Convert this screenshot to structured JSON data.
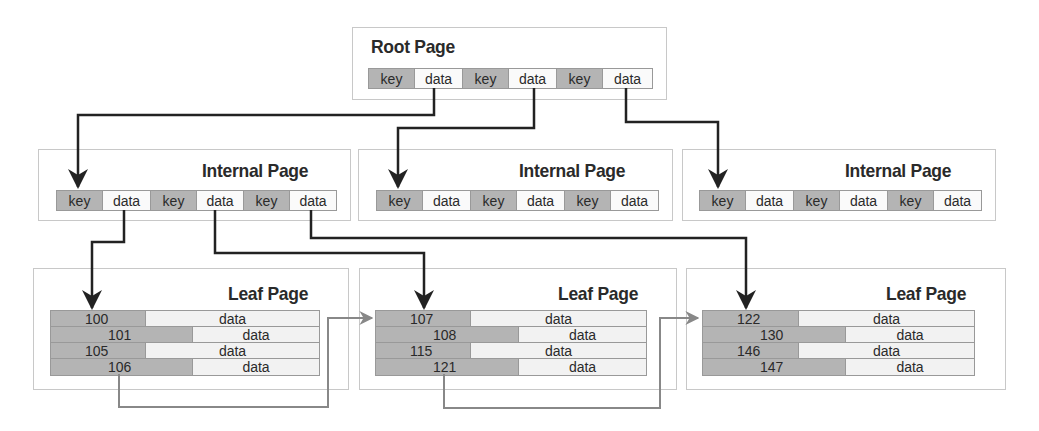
{
  "root": {
    "title": "Root Page",
    "cells": [
      "key",
      "data",
      "key",
      "data",
      "key",
      "data"
    ]
  },
  "internal": [
    {
      "title": "Internal Page",
      "cells": [
        "key",
        "data",
        "key",
        "data",
        "key",
        "data"
      ]
    },
    {
      "title": "Internal Page",
      "cells": [
        "key",
        "data",
        "key",
        "data",
        "key",
        "data"
      ]
    },
    {
      "title": "Internal Page",
      "cells": [
        "key",
        "data",
        "key",
        "data",
        "key",
        "data"
      ]
    }
  ],
  "leaves": [
    {
      "title": "Leaf Page",
      "rows": [
        {
          "key": "100",
          "data": "data"
        },
        {
          "key": "101",
          "data": "data"
        },
        {
          "key": "105",
          "data": "data"
        },
        {
          "key": "106",
          "data": "data"
        }
      ]
    },
    {
      "title": "Leaf Page",
      "rows": [
        {
          "key": "107",
          "data": "data"
        },
        {
          "key": "108",
          "data": "data"
        },
        {
          "key": "115",
          "data": "data"
        },
        {
          "key": "121",
          "data": "data"
        }
      ]
    },
    {
      "title": "Leaf Page",
      "rows": [
        {
          "key": "122",
          "data": "data"
        },
        {
          "key": "130",
          "data": "data"
        },
        {
          "key": "146",
          "data": "data"
        },
        {
          "key": "147",
          "data": "data"
        }
      ]
    }
  ],
  "colors": {
    "key_fill": "#b4b4b4",
    "data_fill": "#fafafa",
    "pointer": "#222222",
    "sibling_link": "#777777"
  }
}
